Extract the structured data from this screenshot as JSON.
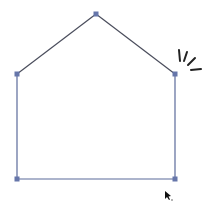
{
  "diagram": {
    "shape": "house-pentagon",
    "stroke_color": "#4a4d5c",
    "edge_color_blue": "#5b6a9a",
    "handle_color": "#6676aa",
    "vertices": [
      {
        "name": "apex",
        "x": 96,
        "y": 14
      },
      {
        "name": "top-left",
        "x": 17,
        "y": 74
      },
      {
        "name": "top-right",
        "x": 175,
        "y": 74
      },
      {
        "name": "bottom-left",
        "x": 17,
        "y": 179
      },
      {
        "name": "bottom-right",
        "x": 175,
        "y": 179
      }
    ],
    "emphasis_mark": "burst-lines-near-top-right-vertex",
    "cursor": {
      "x": 166,
      "y": 193
    }
  }
}
